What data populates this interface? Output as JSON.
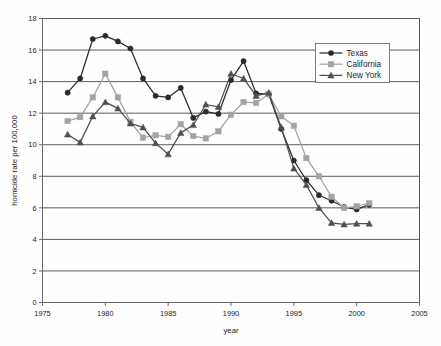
{
  "chart_data": {
    "type": "line",
    "title": "",
    "xlabel": "year",
    "ylabel": "homicide rate per 100,000",
    "xlim": [
      1975,
      2005
    ],
    "ylim": [
      0,
      18
    ],
    "xticks": [
      1975,
      1980,
      1985,
      1990,
      1995,
      2000,
      2005
    ],
    "yticks": [
      0,
      2,
      4,
      6,
      8,
      10,
      12,
      14,
      16,
      18
    ],
    "grid": "horizontal",
    "legend_position": "top-right",
    "x": [
      1977,
      1978,
      1979,
      1980,
      1981,
      1982,
      1983,
      1984,
      1985,
      1986,
      1987,
      1988,
      1989,
      1990,
      1991,
      1992,
      1993,
      1994,
      1995,
      1996,
      1997,
      1998,
      1999,
      2000,
      2001
    ],
    "series": [
      {
        "name": "Texas",
        "color": "#2b2b2b",
        "marker": "circle",
        "values": [
          13.3,
          14.2,
          16.7,
          16.9,
          16.55,
          16.1,
          14.2,
          13.1,
          13.0,
          13.6,
          11.7,
          12.1,
          11.95,
          14.1,
          15.3,
          13.25,
          13.2,
          11.0,
          9.0,
          7.75,
          6.8,
          6.45,
          6.05,
          5.9,
          6.2
        ]
      },
      {
        "name": "California",
        "color": "#a3a3a3",
        "marker": "square",
        "values": [
          11.5,
          11.75,
          13.0,
          14.5,
          13.0,
          11.45,
          10.45,
          10.6,
          10.5,
          11.3,
          10.55,
          10.4,
          10.85,
          11.9,
          12.7,
          12.65,
          13.2,
          11.8,
          11.2,
          9.15,
          8.0,
          6.7,
          6.0,
          6.1,
          6.3
        ]
      },
      {
        "name": "New York",
        "color": "#4f4f4f",
        "marker": "triangle",
        "values": [
          10.65,
          10.15,
          11.8,
          12.7,
          12.3,
          11.35,
          11.1,
          10.1,
          9.4,
          10.75,
          11.25,
          12.55,
          12.4,
          14.5,
          14.2,
          13.1,
          13.3,
          11.1,
          8.5,
          7.45,
          6.0,
          5.05,
          4.95,
          5.0,
          5.0
        ]
      }
    ]
  },
  "axes": {
    "x_tick_labels": [
      "1975",
      "1980",
      "1985",
      "1990",
      "1995",
      "2000",
      "2005"
    ],
    "y_tick_labels": [
      "0",
      "2",
      "4",
      "6",
      "8",
      "10",
      "12",
      "14",
      "16",
      "18"
    ],
    "x_axis_title": "year",
    "y_axis_title": "homicide rate per 100,000"
  },
  "legend": {
    "entries": [
      {
        "label": "Texas",
        "color": "#2b2b2b",
        "marker": "circle"
      },
      {
        "label": "California",
        "color": "#a3a3a3",
        "marker": "square"
      },
      {
        "label": "New York",
        "color": "#4f4f4f",
        "marker": "triangle"
      }
    ]
  }
}
